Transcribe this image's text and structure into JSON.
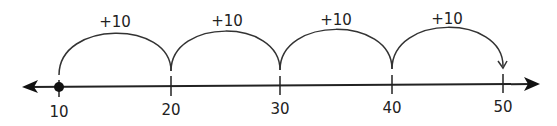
{
  "diagram": {
    "type": "number-line",
    "line": {
      "y": 86,
      "x_start": 23,
      "x_end": 540,
      "color": "#222222"
    },
    "ticks": [
      {
        "value": "10",
        "x": 59
      },
      {
        "value": "20",
        "x": 171
      },
      {
        "value": "30",
        "x": 280
      },
      {
        "value": "40",
        "x": 392
      },
      {
        "value": "50",
        "x": 503
      }
    ],
    "start_point": {
      "value": "10",
      "x": 59
    },
    "jumps": [
      {
        "label": "+10",
        "from": "10",
        "to": "20"
      },
      {
        "label": "+10",
        "from": "20",
        "to": "30"
      },
      {
        "label": "+10",
        "from": "30",
        "to": "40"
      },
      {
        "label": "+10",
        "from": "40",
        "to": "50"
      }
    ]
  }
}
